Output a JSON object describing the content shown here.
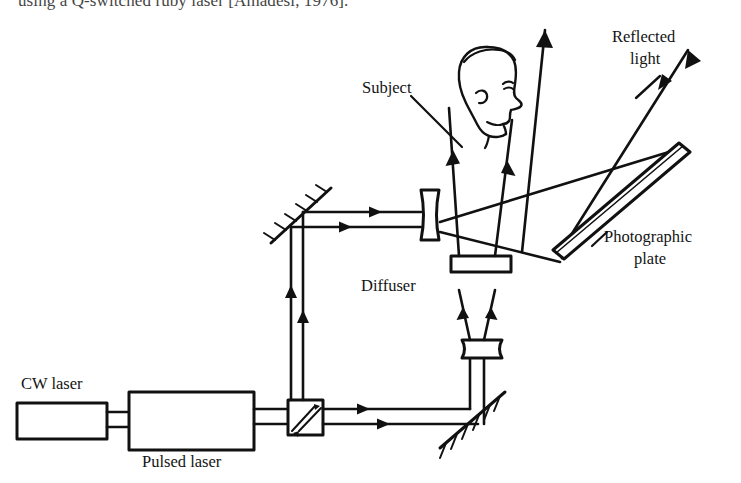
{
  "page": {
    "truncated_caption": "using a Q-switched ruby laser [Amadesi, 1976].",
    "figure_type": "optical-holography-setup-diagram"
  },
  "labels": {
    "subject": "Subject",
    "reflected_light_line1": "Reflected",
    "reflected_light_line2": "light",
    "photographic_plate_line1": "Photographic",
    "photographic_plate_line2": "plate",
    "diffuser": "Diffuser",
    "cw_laser": "CW laser",
    "pulsed_laser": "Pulsed laser"
  },
  "components": [
    {
      "name": "cw-laser",
      "label": "CW laser",
      "shape": "rectangle"
    },
    {
      "name": "pulsed-laser",
      "label": "Pulsed laser",
      "shape": "rectangle"
    },
    {
      "name": "beam-splitter",
      "label": "",
      "shape": "square"
    },
    {
      "name": "mirror-upper-left",
      "label": "",
      "shape": "hatched-mirror-45"
    },
    {
      "name": "mirror-lower-right",
      "label": "",
      "shape": "hatched-mirror-45"
    },
    {
      "name": "beam-expander-lens",
      "label": "",
      "shape": "biconcave-lens"
    },
    {
      "name": "diffuser-plate",
      "label": "Diffuser",
      "shape": "flat-plate"
    },
    {
      "name": "objective-lens",
      "label": "",
      "shape": "lens"
    },
    {
      "name": "photographic-plate",
      "label": "Photographic plate",
      "shape": "tilted-slab"
    },
    {
      "name": "subject-head",
      "label": "Subject",
      "shape": "head-profile"
    }
  ],
  "beams": {
    "reference_arm": "horizontal from lasers through beam splitter to lower-right mirror",
    "object_arm": "up from beam splitter to upper-left mirror, right to lens, then to subject",
    "reflected": "from subject and plate toward upper right"
  },
  "colors": {
    "ink": "#111111",
    "paper": "#ffffff",
    "caption_ink": "#2a2a2a"
  }
}
